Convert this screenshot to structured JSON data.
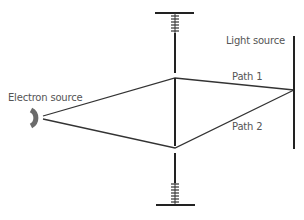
{
  "diagram": {
    "type": "interferometer-schematic",
    "labels": {
      "electron_source": "Electron source",
      "light_source": "Light source",
      "path1": "Path 1",
      "path2": "Path 2"
    },
    "colors": {
      "line": "#222222",
      "source": "#6b6b6b",
      "label": "#555555"
    }
  }
}
